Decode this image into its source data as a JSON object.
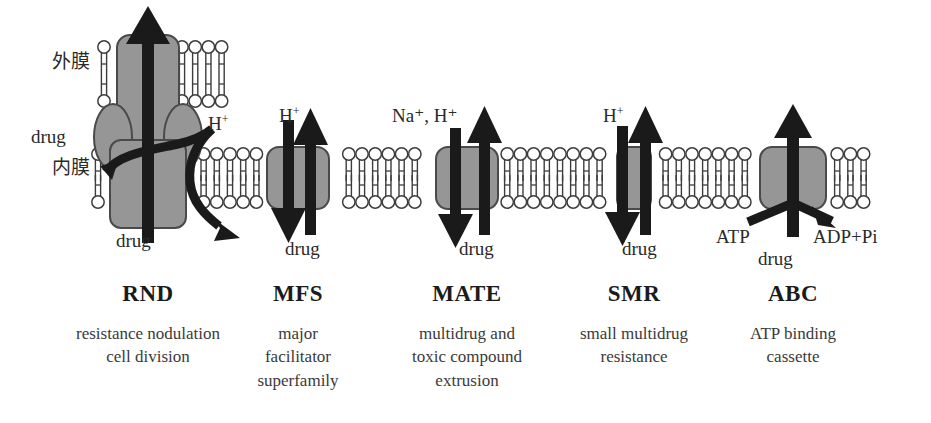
{
  "figure": {
    "type": "diagram",
    "membrane_labels": {
      "outer": "外膜",
      "inner": "内膜"
    }
  },
  "colors": {
    "protein_fill": "#969696",
    "protein_stroke": "#4a4a4a",
    "arrow": "#1a1a1a",
    "lipid_stroke": "#3d3d3d",
    "lipid_fill": "#ffffff",
    "text": "#2a2a2a",
    "background": "#ffffff"
  },
  "pumps": [
    {
      "id": "rnd",
      "name": "RND",
      "description_lines": [
        "resistance nodulation",
        "cell division"
      ],
      "spans": [
        "outer",
        "inner"
      ],
      "substrate_label": "drug",
      "substrate_label_top": "drug",
      "substrate_direction": "up",
      "ion_label": "H",
      "ion_charge": "+",
      "ion_direction": "in",
      "energy": "proton motive force"
    },
    {
      "id": "mfs",
      "name": "MFS",
      "description_lines": [
        "major",
        "facilitator",
        "superfamily"
      ],
      "spans": [
        "inner"
      ],
      "substrate_label": "drug",
      "substrate_direction": "up",
      "ion_label": "H",
      "ion_charge": "+",
      "ion_direction": "down",
      "energy": "proton motive force"
    },
    {
      "id": "mate",
      "name": "MATE",
      "description_lines": [
        "multidrug and",
        "toxic compound",
        "extrusion"
      ],
      "spans": [
        "inner"
      ],
      "substrate_label": "drug",
      "substrate_direction": "up",
      "ion_label": "Na⁺, H⁺",
      "ion_direction": "down",
      "energy": "sodium or proton motive force"
    },
    {
      "id": "smr",
      "name": "SMR",
      "description_lines": [
        "small multidrug",
        "resistance"
      ],
      "spans": [
        "inner"
      ],
      "substrate_label": "drug",
      "substrate_direction": "up",
      "ion_label": "H",
      "ion_charge": "+",
      "ion_direction": "down",
      "energy": "proton motive force"
    },
    {
      "id": "abc",
      "name": "ABC",
      "description_lines": [
        "ATP binding",
        "cassette"
      ],
      "spans": [
        "inner"
      ],
      "substrate_label": "drug",
      "substrate_direction": "up",
      "energy_source_label": "ATP",
      "energy_product_label": "ADP+Pi",
      "energy": "ATP hydrolysis"
    }
  ]
}
